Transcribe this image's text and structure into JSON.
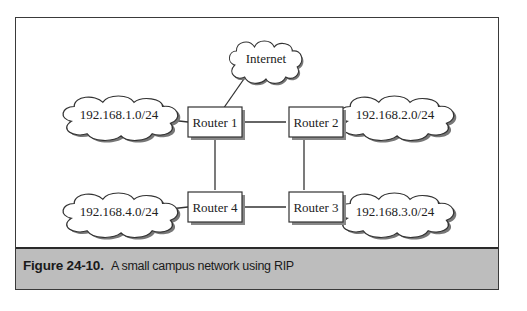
{
  "diagram": {
    "routers": [
      {
        "id": "r1",
        "label": "Router 1"
      },
      {
        "id": "r2",
        "label": "Router 2"
      },
      {
        "id": "r3",
        "label": "Router 3"
      },
      {
        "id": "r4",
        "label": "Router 4"
      }
    ],
    "clouds": [
      {
        "id": "internet",
        "label": "Internet"
      },
      {
        "id": "net1",
        "label": "192.168.1.0/24"
      },
      {
        "id": "net2",
        "label": "192.168.2.0/24"
      },
      {
        "id": "net3",
        "label": "192.168.3.0/24"
      },
      {
        "id": "net4",
        "label": "192.168.4.0/24"
      }
    ],
    "links": [
      [
        "r1",
        "r2"
      ],
      [
        "r2",
        "r3"
      ],
      [
        "r3",
        "r4"
      ],
      [
        "r4",
        "r1"
      ],
      [
        "r1",
        "internet"
      ],
      [
        "r1",
        "net1"
      ],
      [
        "r2",
        "net2"
      ],
      [
        "r3",
        "net3"
      ],
      [
        "r4",
        "net4"
      ]
    ]
  },
  "caption": {
    "number": "Figure 24-10.",
    "text": "A small campus network using RIP"
  }
}
